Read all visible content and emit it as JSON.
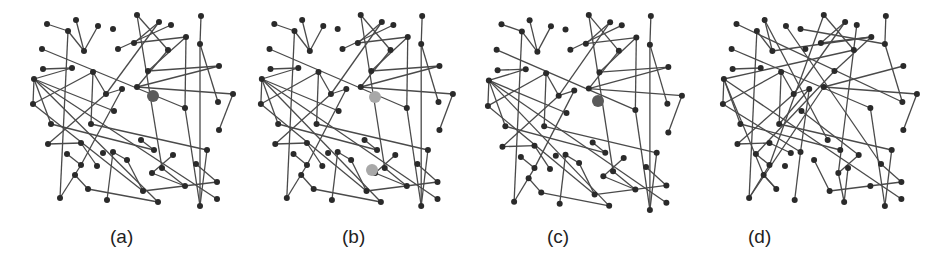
{
  "figure": {
    "panels": [
      {
        "id": "a",
        "label": "(a)",
        "label_x": 110,
        "offset_x": 0,
        "highlights": [
          {
            "x": 153,
            "y": 96,
            "r": 6,
            "color": "#5a5a5a"
          }
        ]
      },
      {
        "id": "b",
        "label": "(b)",
        "label_x": 342,
        "offset_x": 0,
        "highlights": [
          {
            "x": 375,
            "y": 97,
            "r": 6,
            "color": "#a8a8a8"
          },
          {
            "x": 372,
            "y": 170,
            "r": 6,
            "color": "#a8a8a8"
          }
        ]
      },
      {
        "id": "c",
        "label": "(c)",
        "label_x": 547,
        "offset_x": 0,
        "highlights": [
          {
            "x": 598,
            "y": 101,
            "r": 6,
            "color": "#5a5a5a"
          }
        ]
      },
      {
        "id": "d",
        "label": "(d)",
        "label_x": 748,
        "offset_x": 0,
        "highlights": []
      }
    ],
    "colors": {
      "node": "#2a2a2a",
      "edge": "#4a4a4a",
      "highlight_dark": "#5a5a5a",
      "highlight_light": "#a8a8a8"
    }
  },
  "graph_a": {
    "nodes": [
      [
        47,
        24
      ],
      [
        76,
        20
      ],
      [
        68,
        31
      ],
      [
        98,
        26
      ],
      [
        113,
        29
      ],
      [
        84,
        51
      ],
      [
        137,
        15
      ],
      [
        159,
        22
      ],
      [
        171,
        25
      ],
      [
        186,
        37
      ],
      [
        201,
        16
      ],
      [
        200,
        44
      ],
      [
        134,
        43
      ],
      [
        118,
        49
      ],
      [
        168,
        50
      ],
      [
        42,
        49
      ],
      [
        43,
        69
      ],
      [
        72,
        68
      ],
      [
        93,
        72
      ],
      [
        148,
        71
      ],
      [
        219,
        66
      ],
      [
        34,
        79
      ],
      [
        122,
        89
      ],
      [
        137,
        87
      ],
      [
        185,
        108
      ],
      [
        218,
        102
      ],
      [
        233,
        94
      ],
      [
        33,
        104
      ],
      [
        106,
        94
      ],
      [
        114,
        111
      ],
      [
        51,
        124
      ],
      [
        91,
        124
      ],
      [
        219,
        130
      ],
      [
        48,
        144
      ],
      [
        81,
        143
      ],
      [
        67,
        154
      ],
      [
        81,
        165
      ],
      [
        97,
        166
      ],
      [
        103,
        153
      ],
      [
        141,
        140
      ],
      [
        154,
        150
      ],
      [
        113,
        152
      ],
      [
        173,
        155
      ],
      [
        127,
        160
      ],
      [
        152,
        173
      ],
      [
        162,
        168
      ],
      [
        196,
        164
      ],
      [
        207,
        150
      ],
      [
        75,
        175
      ],
      [
        88,
        189
      ],
      [
        217,
        182
      ],
      [
        60,
        198
      ],
      [
        107,
        200
      ],
      [
        217,
        199
      ],
      [
        143,
        191
      ],
      [
        158,
        202
      ],
      [
        185,
        186
      ],
      [
        200,
        206
      ]
    ],
    "edges": [
      [
        0,
        2
      ],
      [
        2,
        5
      ],
      [
        1,
        5
      ],
      [
        3,
        5
      ],
      [
        2,
        51
      ],
      [
        4,
        93
      ],
      [
        6,
        14
      ],
      [
        6,
        45
      ],
      [
        7,
        28
      ],
      [
        7,
        12
      ],
      [
        8,
        13
      ],
      [
        9,
        19
      ],
      [
        9,
        12
      ],
      [
        9,
        24
      ],
      [
        10,
        11
      ],
      [
        11,
        25
      ],
      [
        11,
        57
      ],
      [
        15,
        24
      ],
      [
        16,
        17
      ],
      [
        21,
        17
      ],
      [
        21,
        27
      ],
      [
        21,
        30
      ],
      [
        21,
        55
      ],
      [
        21,
        53
      ],
      [
        27,
        18
      ],
      [
        27,
        54
      ],
      [
        18,
        31
      ],
      [
        18,
        28
      ],
      [
        22,
        36
      ],
      [
        28,
        33
      ],
      [
        33,
        34
      ],
      [
        34,
        37
      ],
      [
        35,
        36
      ],
      [
        36,
        51
      ],
      [
        23,
        14
      ],
      [
        23,
        26
      ],
      [
        24,
        57
      ],
      [
        19,
        20
      ],
      [
        20,
        23
      ],
      [
        22,
        28
      ],
      [
        39,
        40
      ],
      [
        40,
        30
      ],
      [
        31,
        47
      ],
      [
        41,
        43
      ],
      [
        42,
        44
      ],
      [
        43,
        54
      ],
      [
        44,
        56
      ],
      [
        47,
        57
      ],
      [
        48,
        49
      ],
      [
        49,
        55
      ],
      [
        50,
        54
      ],
      [
        52,
        41
      ],
      [
        29,
        21
      ],
      [
        32,
        26
      ],
      [
        46,
        50
      ],
      [
        45,
        56
      ]
    ]
  }
}
